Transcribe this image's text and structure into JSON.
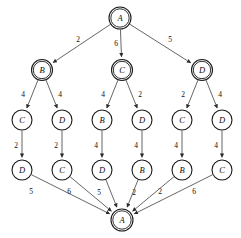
{
  "diagram": {
    "background_color": "#ffffff",
    "edge_color": "#4a4a4a",
    "node_stroke_color": "#1a1a1a",
    "node_fill_color": "#ffffff",
    "text_color": "#0d0d0d",
    "nodes": [
      {
        "id": "n0",
        "label": "A",
        "x": 120,
        "y": 18,
        "r": 11,
        "double": true
      },
      {
        "id": "n1",
        "label": "B",
        "x": 42,
        "y": 70,
        "r": 10.5,
        "double": true
      },
      {
        "id": "n2",
        "label": "C",
        "x": 122,
        "y": 70,
        "r": 10.5,
        "double": true
      },
      {
        "id": "n3",
        "label": "D",
        "x": 202,
        "y": 70,
        "r": 10.5,
        "double": true
      },
      {
        "id": "n4",
        "label": "C",
        "x": 22,
        "y": 120,
        "r": 10,
        "double": false
      },
      {
        "id": "n5",
        "label": "D",
        "x": 62,
        "y": 120,
        "r": 10,
        "double": false
      },
      {
        "id": "n6",
        "label": "B",
        "x": 102,
        "y": 120,
        "r": 10,
        "double": false
      },
      {
        "id": "n7",
        "label": "D",
        "x": 142,
        "y": 120,
        "r": 10,
        "double": false
      },
      {
        "id": "n8",
        "label": "C",
        "x": 182,
        "y": 120,
        "r": 10,
        "double": false
      },
      {
        "id": "n9",
        "label": "D",
        "x": 222,
        "y": 120,
        "r": 10,
        "double": false
      },
      {
        "id": "n10",
        "label": "D",
        "x": 22,
        "y": 170,
        "r": 10,
        "double": false
      },
      {
        "id": "n11",
        "label": "C",
        "x": 62,
        "y": 170,
        "r": 10,
        "double": false
      },
      {
        "id": "n12",
        "label": "D",
        "x": 102,
        "y": 170,
        "r": 10,
        "double": false
      },
      {
        "id": "n13",
        "label": "B",
        "x": 142,
        "y": 170,
        "r": 10,
        "double": false
      },
      {
        "id": "n14",
        "label": "B",
        "x": 182,
        "y": 170,
        "r": 10,
        "double": false
      },
      {
        "id": "n15",
        "label": "C",
        "x": 222,
        "y": 170,
        "r": 10,
        "double": false
      },
      {
        "id": "n16",
        "label": "A",
        "x": 122,
        "y": 220,
        "r": 11,
        "double": true
      }
    ],
    "edges": [
      {
        "from": "n0",
        "to": "n1",
        "weight": "2",
        "lx": 78,
        "ly": 39
      },
      {
        "from": "n0",
        "to": "n2",
        "weight": "6",
        "lx": 116,
        "ly": 43
      },
      {
        "from": "n0",
        "to": "n3",
        "weight": "5",
        "lx": 170,
        "ly": 39
      },
      {
        "from": "n1",
        "to": "n4",
        "weight": "4",
        "lx": 23,
        "ly": 94
      },
      {
        "from": "n1",
        "to": "n5",
        "weight": "4",
        "lx": 60,
        "ly": 94
      },
      {
        "from": "n2",
        "to": "n6",
        "weight": "4",
        "lx": 103,
        "ly": 94
      },
      {
        "from": "n2",
        "to": "n7",
        "weight": "2",
        "lx": 140,
        "ly": 94
      },
      {
        "from": "n3",
        "to": "n8",
        "weight": "2",
        "lx": 183,
        "ly": 94
      },
      {
        "from": "n3",
        "to": "n9",
        "weight": "4",
        "lx": 220,
        "ly": 94
      },
      {
        "from": "n4",
        "to": "n10",
        "weight": "2",
        "lx": 16,
        "ly": 145
      },
      {
        "from": "n5",
        "to": "n11",
        "weight": "2",
        "lx": 56,
        "ly": 145
      },
      {
        "from": "n6",
        "to": "n12",
        "weight": "4",
        "lx": 96,
        "ly": 145
      },
      {
        "from": "n7",
        "to": "n13",
        "weight": "4",
        "lx": 136,
        "ly": 145
      },
      {
        "from": "n8",
        "to": "n14",
        "weight": "4",
        "lx": 176,
        "ly": 145
      },
      {
        "from": "n9",
        "to": "n15",
        "weight": "4",
        "lx": 216,
        "ly": 145
      },
      {
        "from": "n10",
        "to": "n16",
        "weight": "5",
        "lx": 31,
        "ly": 191
      },
      {
        "from": "n11",
        "to": "n16",
        "weight": "6",
        "lx": 69,
        "ly": 191
      },
      {
        "from": "n12",
        "to": "n16",
        "weight": "5",
        "lx": 99,
        "ly": 192
      },
      {
        "from": "n13",
        "to": "n16",
        "weight": "2",
        "lx": 134,
        "ly": 192
      },
      {
        "from": "n14",
        "to": "n16",
        "weight": "2",
        "lx": 160,
        "ly": 191
      },
      {
        "from": "n15",
        "to": "n16",
        "weight": "6",
        "lx": 194,
        "ly": 191
      }
    ]
  }
}
